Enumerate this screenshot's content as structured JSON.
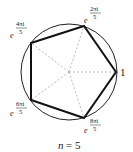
{
  "diagram": {
    "title": "n = 5",
    "n_label": "n",
    "eq": "= 5",
    "vertices": [
      {
        "id": "v0",
        "label": "1"
      },
      {
        "id": "v1",
        "base": "e",
        "exp_num": "2πi",
        "exp_den": "5"
      },
      {
        "id": "v2",
        "base": "e",
        "exp_num": "4πi",
        "exp_den": "5"
      },
      {
        "id": "v3",
        "base": "e",
        "exp_num": "6πi",
        "exp_den": "5"
      },
      {
        "id": "v4",
        "base": "e",
        "exp_num": "8πi",
        "exp_den": "5"
      }
    ]
  }
}
